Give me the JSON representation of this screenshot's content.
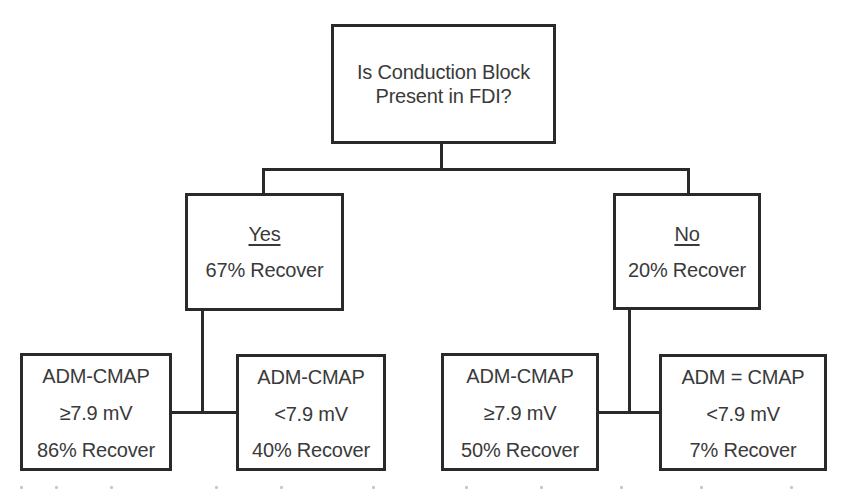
{
  "diagram": {
    "type": "decision-tree",
    "root": {
      "question_line1": "Is Conduction Block",
      "question_line2": "Present in FDI?"
    },
    "branches": [
      {
        "label": "Yes",
        "outcome": "67% Recover",
        "children": [
          {
            "line1": "ADM-CMAP",
            "line2": "≥7.9 mV",
            "line3": "86% Recover"
          },
          {
            "line1": "ADM-CMAP",
            "line2": "<7.9 mV",
            "line3": "40% Recover"
          }
        ]
      },
      {
        "label": "No",
        "outcome": "20% Recover",
        "children": [
          {
            "line1": "ADM-CMAP",
            "line2": "≥7.9 mV",
            "line3": "50% Recover"
          },
          {
            "line1": "ADM = CMAP",
            "line2": "<7.9 mV",
            "line3": "7% Recover"
          }
        ]
      }
    ]
  },
  "colors": {
    "border": "#2a2a2a",
    "text": "#3a3a3a",
    "background": "#ffffff"
  }
}
